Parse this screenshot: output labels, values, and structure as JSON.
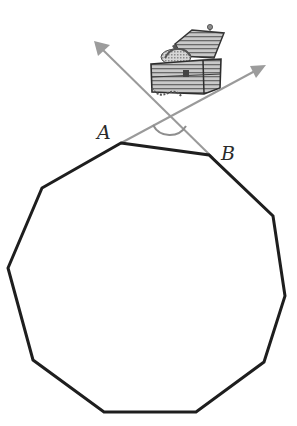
{
  "figure": {
    "type": "diagram",
    "labels": {
      "vertex_a": "A",
      "vertex_b": "B"
    },
    "colors": {
      "polygon_stroke": "#1e1e1e",
      "ray_stroke": "#9a9a9a",
      "arc_stroke": "#8e8e8e",
      "background": "#ffffff"
    },
    "polygon": {
      "sides": 10,
      "vertices": [
        [
          121,
          143
        ],
        [
          209,
          155
        ],
        [
          273,
          216
        ],
        [
          285,
          296
        ],
        [
          264,
          362
        ],
        [
          196,
          412
        ],
        [
          104,
          412
        ],
        [
          33,
          360
        ],
        [
          8,
          268
        ],
        [
          42,
          188
        ]
      ]
    },
    "rays": [
      {
        "name": "ray-from-a",
        "from": [
          121,
          143
        ],
        "to": [
          266,
          65
        ]
      },
      {
        "name": "ray-from-b",
        "from": [
          209,
          155
        ],
        "to": [
          94,
          41
        ]
      }
    ],
    "angle_marker": {
      "center": [
        170,
        116
      ],
      "radius": 19
    },
    "image": {
      "name": "treasure-chest",
      "position": [
        150,
        22
      ],
      "size": [
        75,
        78
      ]
    }
  }
}
